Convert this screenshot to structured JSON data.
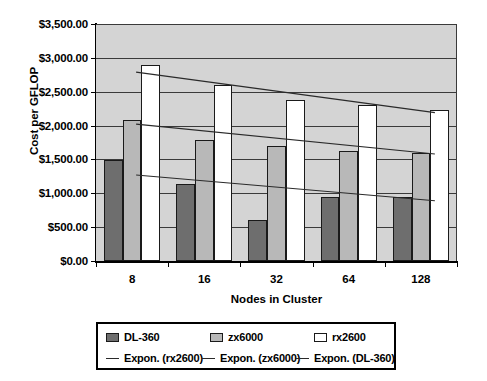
{
  "chart_data": {
    "type": "bar",
    "title": "",
    "xlabel": "Nodes in Cluster",
    "ylabel": "Cost per GFLOP",
    "categories": [
      "8",
      "16",
      "32",
      "64",
      "128"
    ],
    "series": [
      {
        "name": "DL-360",
        "color": "#6e6e6e",
        "values": [
          1490,
          1130,
          610,
          950,
          945
        ]
      },
      {
        "name": "zx6000",
        "color": "#b8b8b8",
        "values": [
          2080,
          1790,
          1700,
          1620,
          1600
        ]
      },
      {
        "name": "rx2600",
        "color": "#ffffff",
        "values": [
          2900,
          2600,
          2380,
          2300,
          2225
        ]
      }
    ],
    "trendlines": [
      {
        "name": "Expon. (rx2600)",
        "color": "#2a2a2a",
        "start_value": 2790,
        "end_value": 2190
      },
      {
        "name": "Expon. (zx6000)",
        "color": "#2a2a2a",
        "start_value": 2020,
        "end_value": 1580
      },
      {
        "name": "Expon. (DL-360)",
        "color": "#2a2a2a",
        "start_value": 1270,
        "end_value": 890
      }
    ],
    "ylim": [
      0,
      3500
    ],
    "ytick_values": [
      0,
      500,
      1000,
      1500,
      2000,
      2500,
      3000,
      3500
    ],
    "ytick_labels": [
      "$0.00",
      "$500.00",
      "$1,000.00",
      "$1,500.00",
      "$2,000.00",
      "$2,500.00",
      "$3,000.00",
      "$3,500.00"
    ],
    "grid": true,
    "legend_position": "bottom",
    "plot_background": "#d4d4d4"
  },
  "legend": {
    "items": [
      {
        "label": "DL-360",
        "marker": "swatch",
        "series": "s-dl360"
      },
      {
        "label": "zx6000",
        "marker": "swatch",
        "series": "s-zx6000"
      },
      {
        "label": "rx2600",
        "marker": "swatch",
        "series": "s-rx2600"
      },
      {
        "label": "Expon. (rx2600)",
        "marker": "line",
        "series": "trend"
      },
      {
        "label": "Expon. (zx6000)",
        "marker": "line",
        "series": "trend"
      },
      {
        "label": "Expon. (DL-360)",
        "marker": "line",
        "series": "trend"
      }
    ]
  }
}
